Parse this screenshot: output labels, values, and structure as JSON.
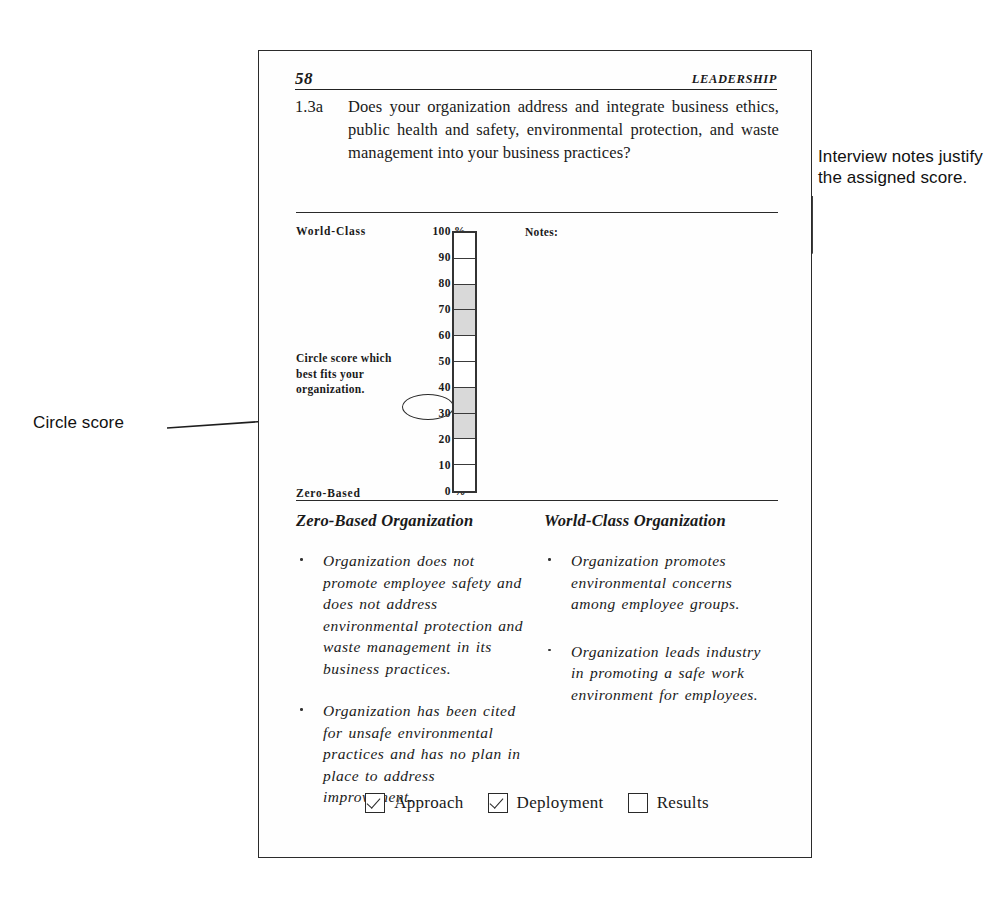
{
  "page": {
    "number": "58",
    "running_head": "LEADERSHIP"
  },
  "question": {
    "number": "1.3a",
    "text": "Does your organization address and integrate business ethics, public health and safety, environmental protection, and waste management into your business practices?"
  },
  "scale": {
    "top_label": "World-Class",
    "bottom_label": "Zero-Based",
    "instruction": "Circle score which best fits your organization.",
    "notes_label": "Notes:",
    "circled_value": "30 %",
    "ticks": [
      "100 %",
      "90 %",
      "80 %",
      "70 %",
      "60 %",
      "50 %",
      "40 %",
      "30 %",
      "20 %",
      "10 %",
      "0 %"
    ],
    "cells_shaded": [
      false,
      false,
      true,
      true,
      false,
      false,
      true,
      true,
      false,
      false
    ]
  },
  "columns": {
    "left": {
      "heading": "Zero-Based Organization",
      "bullets": [
        "Organization does not promote employee safety and does not address environmental protection and waste management in its business practices.",
        "Organization has been cited for unsafe environmental practices and has no plan in place to address improvement."
      ]
    },
    "right": {
      "heading": "World-Class Organization",
      "bullets": [
        "Organization promotes environmental concerns among employee groups.",
        "Organization leads industry in promoting a safe work environment for employees."
      ]
    }
  },
  "checkboxes": [
    {
      "label": "Approach",
      "checked": true
    },
    {
      "label": "Deployment",
      "checked": true
    },
    {
      "label": "Results",
      "checked": false
    }
  ],
  "annotations": {
    "notes": "Interview notes justify the assigned score.",
    "circle": "Circle score"
  },
  "colors": {
    "ink": "#2a2a2a",
    "shaded_cell": "#d9d9d9"
  }
}
